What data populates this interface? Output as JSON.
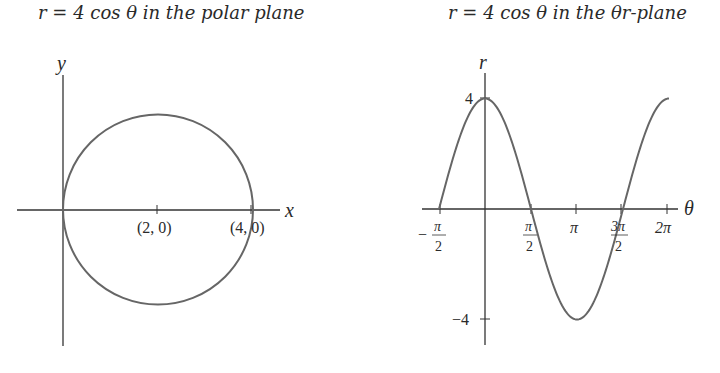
{
  "left": {
    "title_math": "r = 4 cos θ",
    "title_text": "in the polar plane",
    "x_axis_label": "x",
    "y_axis_label": "y",
    "point_labels": [
      "(2, 0)",
      "(4, 0)"
    ]
  },
  "right": {
    "title_math": "r = 4 cos θ",
    "title_text": "in the θr-plane",
    "x_axis_label": "θ",
    "y_axis_label": "r",
    "y_tick_labels": [
      "4",
      "−4"
    ],
    "x_tick_labels": [
      {
        "num": "π",
        "den": "2",
        "sign": "−"
      },
      {
        "num": "π",
        "den": "2",
        "sign": ""
      },
      {
        "text": "π"
      },
      {
        "num": "3π",
        "den": "2",
        "sign": ""
      },
      {
        "text": "2π"
      }
    ]
  },
  "chart_data": [
    {
      "type": "line",
      "title": "r = 4cos θ in the polar plane",
      "xlabel": "x",
      "ylabel": "y",
      "shape": "circle",
      "center": [
        2,
        0
      ],
      "radius": 2,
      "annotated_points": [
        {
          "label": "(2, 0)",
          "x": 2,
          "y": 0
        },
        {
          "label": "(4, 0)",
          "x": 4,
          "y": 0
        }
      ],
      "grid": false
    },
    {
      "type": "line",
      "title": "r = 4cos θ in the θr-plane",
      "xlabel": "θ",
      "ylabel": "r",
      "x_ticks": [
        "−π/2",
        "π/2",
        "π",
        "3π/2",
        "2π"
      ],
      "y_ticks": [
        "4",
        "−4"
      ],
      "x": [
        -1.5708,
        -0.7854,
        0,
        0.7854,
        1.5708,
        2.3562,
        3.1416,
        3.927,
        4.7124,
        5.4978,
        6.2832
      ],
      "values": [
        0,
        2.83,
        4,
        2.83,
        0,
        -2.83,
        -4,
        -2.83,
        0,
        2.83,
        4
      ],
      "xlim": [
        -1.5708,
        6.2832
      ],
      "ylim": [
        -4,
        4
      ],
      "grid": false
    }
  ]
}
